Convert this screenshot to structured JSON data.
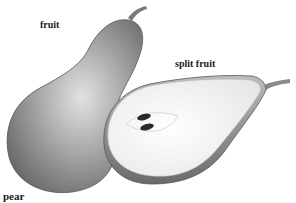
{
  "labels": {
    "fruit": "fruit",
    "split_fruit": "split fruit",
    "pear": "pear"
  },
  "colors": {
    "skin_dark": "#6e6e6e",
    "skin_mid": "#9a9a9a",
    "skin_light": "#d4d4d4",
    "flesh": "#fbfbfb",
    "seed": "#2a2a2a"
  }
}
